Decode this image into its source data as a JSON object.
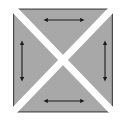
{
  "figure": {
    "type": "geometric-diagram",
    "background_color": "#ffffff"
  },
  "canvas": {
    "width": 126,
    "height": 123
  },
  "square": {
    "label": "outer-square",
    "x": 13,
    "y": 8,
    "width": 100,
    "height": 104,
    "outline_color": "#4a4a4a",
    "outline_width": 1.2
  },
  "diagonals": {
    "label": "white-x-separator",
    "color": "#ffffff",
    "stroke_width": 7,
    "description": "Two white diagonal bands crossing at the center forming an X that separates the four triangles"
  },
  "triangles": [
    {
      "name": "top-triangle",
      "fill": "#a8a8a8",
      "stroke": "#4a4a4a",
      "points": "13,8 113,8 63,60",
      "arrow": "horizontal"
    },
    {
      "name": "left-triangle",
      "fill": "#a8a8a8",
      "stroke": "#4a4a4a",
      "points": "13,8 13,112 61,60",
      "arrow": "vertical"
    },
    {
      "name": "right-triangle",
      "fill": "#a8a8a8",
      "stroke": "#4a4a4a",
      "points": "113,8 113,112 65,60",
      "arrow": "vertical"
    },
    {
      "name": "bottom-triangle",
      "fill": "#a8a8a8",
      "stroke": "#4a4a4a",
      "points": "13,112 113,112 63,62",
      "arrow": "horizontal"
    }
  ],
  "arrows": [
    {
      "name": "top-arrow",
      "orientation": "horizontal",
      "double_headed": true,
      "color": "#1a1a1a",
      "x1": 47,
      "y1": 20,
      "x2": 81,
      "y2": 20
    },
    {
      "name": "left-arrow",
      "orientation": "vertical",
      "double_headed": true,
      "color": "#1a1a1a",
      "x1": 22,
      "y1": 44,
      "x2": 22,
      "y2": 78
    },
    {
      "name": "right-arrow",
      "orientation": "vertical",
      "double_headed": true,
      "color": "#1a1a1a",
      "x1": 105,
      "y1": 44,
      "x2": 105,
      "y2": 78
    },
    {
      "name": "bottom-arrow",
      "orientation": "horizontal",
      "double_headed": true,
      "color": "#1a1a1a",
      "x1": 47,
      "y1": 101,
      "x2": 81,
      "y2": 101
    }
  ],
  "colors": {
    "triangle_fill": "#a8a8a8",
    "outline": "#4a4a4a",
    "arrow": "#1a1a1a",
    "gap": "#ffffff"
  }
}
